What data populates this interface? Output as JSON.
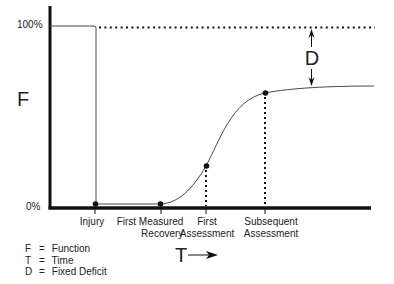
{
  "diagram": {
    "y_axis": {
      "label": "F",
      "tick_top": "100%",
      "tick_bottom": "0%"
    },
    "x_axis": {
      "label": "T",
      "arrow": "right-arrow"
    },
    "fixed_deficit_label": "D",
    "events": [
      {
        "id": "injury",
        "lines": [
          "Injury"
        ]
      },
      {
        "id": "first-measured-recovery",
        "lines": [
          "First Measured",
          "Recovery"
        ]
      },
      {
        "id": "first-assessment",
        "lines": [
          "First",
          "Assessment"
        ]
      },
      {
        "id": "subsequent-assessment",
        "lines": [
          "Subsequent",
          "Assessment"
        ]
      }
    ],
    "legend": [
      {
        "key": "F",
        "eq": "=",
        "value": "Function"
      },
      {
        "key": "T",
        "eq": "=",
        "value": "Time"
      },
      {
        "key": "D",
        "eq": "=",
        "value": "Fixed Deficit"
      }
    ],
    "colors": {
      "axis": "#111111",
      "curve": "#333333",
      "background": "#ffffff"
    }
  }
}
